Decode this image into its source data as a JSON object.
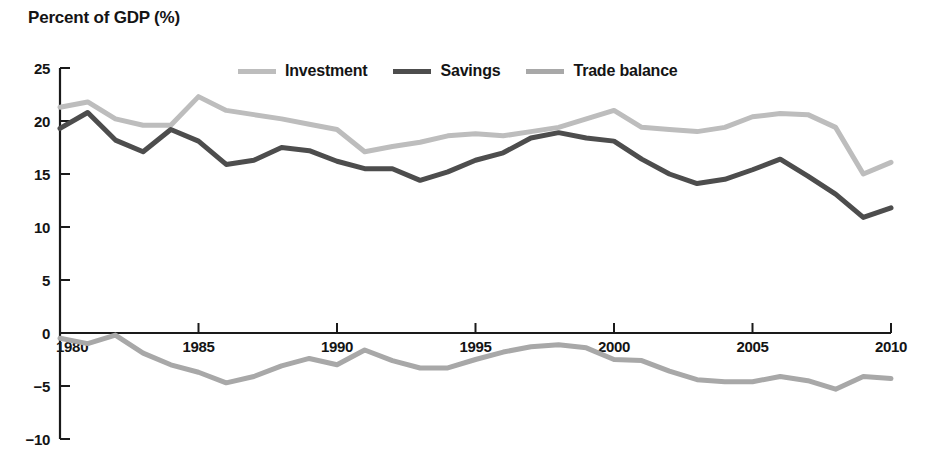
{
  "chart_data": {
    "type": "line",
    "title": "Percent of GDP (%)",
    "xlabel": "",
    "ylabel": "Percent of GDP (%)",
    "xlim": [
      1980,
      2010
    ],
    "ylim": [
      -10,
      25
    ],
    "ytick_values": [
      25,
      20,
      15,
      10,
      5,
      0,
      -5,
      -10
    ],
    "ytick_labels": [
      "25",
      "20",
      "15",
      "10",
      "5",
      "0",
      "−5",
      "−10"
    ],
    "xtick_values": [
      1980,
      1985,
      1990,
      1995,
      2000,
      2005,
      2010
    ],
    "xtick_labels": [
      "1980",
      "1985",
      "1990",
      "1995",
      "2000",
      "2005",
      "2010"
    ],
    "grid": false,
    "legend_position": "top-center",
    "x": [
      1980,
      1981,
      1982,
      1983,
      1984,
      1985,
      1986,
      1987,
      1988,
      1989,
      1990,
      1991,
      1992,
      1993,
      1994,
      1995,
      1996,
      1997,
      1998,
      1999,
      2000,
      2001,
      2002,
      2003,
      2004,
      2005,
      2006,
      2007,
      2008,
      2009,
      2010
    ],
    "series": [
      {
        "name": "Investment",
        "color": "#bdbdbd",
        "values": [
          21.3,
          21.8,
          20.2,
          19.6,
          19.6,
          22.3,
          21.0,
          20.6,
          20.2,
          19.7,
          19.2,
          17.1,
          17.6,
          18.0,
          18.6,
          18.8,
          18.6,
          19.0,
          19.4,
          20.2,
          21.0,
          19.4,
          19.2,
          19.0,
          19.4,
          20.4,
          20.7,
          20.6,
          19.4,
          15.0,
          16.1
        ]
      },
      {
        "name": "Savings",
        "color": "#4d4d4d",
        "values": [
          19.3,
          20.8,
          18.2,
          17.1,
          19.2,
          18.1,
          15.9,
          16.3,
          17.5,
          17.2,
          16.2,
          15.5,
          15.5,
          14.4,
          15.2,
          16.3,
          17.0,
          18.4,
          18.9,
          18.4,
          18.1,
          16.4,
          15.0,
          14.1,
          14.5,
          15.4,
          16.4,
          14.8,
          13.1,
          10.9,
          11.8
        ]
      },
      {
        "name": "Trade balance",
        "color": "#a8a8a8",
        "values": [
          -0.5,
          -1.0,
          -0.2,
          -1.9,
          -3.0,
          -3.7,
          -4.7,
          -4.1,
          -3.1,
          -2.4,
          -3.0,
          -1.6,
          -2.6,
          -3.3,
          -3.3,
          -2.5,
          -1.8,
          -1.3,
          -1.1,
          -1.4,
          -2.5,
          -2.6,
          -3.6,
          -4.4,
          -4.6,
          -4.6,
          -4.1,
          -4.5,
          -5.3,
          -4.1,
          -4.3
        ]
      }
    ]
  },
  "legend": {
    "items": [
      {
        "label": "Investment",
        "color": "#bdbdbd"
      },
      {
        "label": "Savings",
        "color": "#4d4d4d"
      },
      {
        "label": "Trade balance",
        "color": "#a8a8a8"
      }
    ]
  },
  "axes": {
    "title": "Percent of GDP (%)",
    "y_tick_labels": [
      "25",
      "20",
      "15",
      "10",
      "5",
      "0",
      "−5",
      "−10"
    ],
    "x_tick_labels": [
      "1980",
      "1985",
      "1990",
      "1995",
      "2000",
      "2005",
      "2010"
    ]
  }
}
